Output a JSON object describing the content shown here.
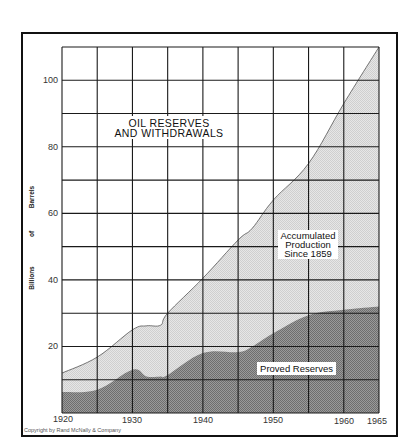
{
  "chart_data": {
    "type": "area",
    "title": "OIL RESERVES AND WITHDRAWALS",
    "title_lines": [
      "OIL RESERVES",
      "AND WITHDRAWALS"
    ],
    "xlabel": "",
    "ylabel": "Billions of Barrels",
    "ylabel_words": [
      "Billions",
      "of",
      "Barrels"
    ],
    "xlim": [
      1920,
      1965
    ],
    "ylim": [
      0,
      110
    ],
    "x_ticks": [
      1920,
      1930,
      1940,
      1950,
      1960,
      1965
    ],
    "y_ticks": [
      20,
      40,
      60,
      80,
      100
    ],
    "x_grid_step": 5,
    "y_grid_step": 10,
    "grid": true,
    "stacked": true,
    "x": [
      1920,
      1925,
      1930,
      1932,
      1934,
      1935,
      1940,
      1945,
      1947,
      1950,
      1955,
      1960,
      1965
    ],
    "series": [
      {
        "name": "Proved Reserves",
        "color": "#8c8c8c",
        "values": [
          6.3,
          7.0,
          13.0,
          11.0,
          11.0,
          11.4,
          18.0,
          18.3,
          20.0,
          24.0,
          29.4,
          31.0,
          32.0
        ]
      },
      {
        "name": "Accumulated Production Since 1859",
        "color": "#dcdcdc",
        "cumulative_top_values": [
          12.0,
          16.8,
          25.0,
          26.2,
          26.4,
          30.0,
          40.5,
          52.0,
          55.5,
          64.0,
          75.0,
          93.0,
          110.0
        ]
      }
    ],
    "annotations": [
      {
        "text_lines": [
          "Accumulated",
          "Production",
          "Since 1859"
        ],
        "x": 1957,
        "y": 53
      },
      {
        "text": "Proved Reserves",
        "x": 1957,
        "y": 13
      }
    ]
  },
  "labels": {
    "title_line1": "OIL RESERVES",
    "title_line2": "AND WITHDRAWALS",
    "accum_line1": "Accumulated",
    "accum_line2": "Production",
    "accum_line3": "Since 1859",
    "proved": "Proved Reserves",
    "ylabel_billions": "Billions",
    "ylabel_of": "of",
    "ylabel_barrels": "Barrels",
    "copyright": "Copyright by Rand McNally & Company"
  },
  "tick_labels": {
    "x": [
      "1920",
      "1930",
      "1940",
      "1950",
      "1960",
      "1965"
    ],
    "y": [
      "20",
      "40",
      "60",
      "80",
      "100"
    ]
  }
}
